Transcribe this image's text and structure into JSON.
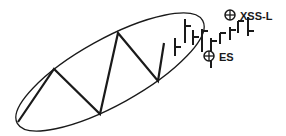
{
  "diagram": {
    "type": "price-pattern",
    "stroke_color": "#1a1a1a",
    "background": "#ffffff",
    "zigzag_points": [
      [
        18,
        122
      ],
      [
        54,
        69
      ],
      [
        100,
        114
      ],
      [
        118,
        33
      ],
      [
        158,
        81
      ],
      [
        164,
        43
      ]
    ],
    "ellipse": {
      "cx": 110,
      "cy": 72,
      "rx": 106,
      "ry": 33,
      "rotate": -29
    },
    "bars": [
      {
        "x": 175,
        "high": 38,
        "low": 56,
        "open": null,
        "close": 47
      },
      {
        "x": 185,
        "high": 19,
        "low": 43,
        "open": null,
        "close": 26
      },
      {
        "x": 193,
        "high": 30,
        "low": 45,
        "open": null,
        "close": 37
      },
      {
        "x": 202,
        "high": 29,
        "low": 52,
        "open": null,
        "close": 31
      },
      {
        "x": 211,
        "high": 38,
        "low": 68,
        "open": null,
        "close": 41
      },
      {
        "x": 220,
        "high": 33,
        "low": 44,
        "open": null,
        "close": 33
      },
      {
        "x": 230,
        "high": 27,
        "low": 40,
        "open": null,
        "close": 30
      },
      {
        "x": 238,
        "high": 21,
        "low": 33,
        "open": null,
        "close": 21
      },
      {
        "x": 248,
        "high": 17,
        "low": 36,
        "open": null,
        "close": 31
      }
    ],
    "markers": [
      {
        "label": "ES",
        "cx": 209,
        "cy": 56,
        "r": 5,
        "label_x": 219,
        "label_y": 61
      },
      {
        "label": "XSS-L",
        "cx": 230,
        "cy": 15,
        "r": 5,
        "label_x": 240,
        "label_y": 20
      }
    ]
  }
}
